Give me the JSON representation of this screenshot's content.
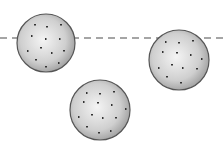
{
  "diagram": {
    "colors": {
      "background": "#ffffff",
      "sphere_light": "#f2f2f2",
      "sphere_dark": "#a8a8a8",
      "outline": "#555555",
      "speckle": "#333333",
      "dash_line": "#888888"
    },
    "reference_line": {
      "y": 38,
      "x1": 0,
      "x2": 223,
      "style": "dashed"
    },
    "spheres": [
      {
        "id": "left",
        "cx": 46,
        "cy": 43,
        "r": 29,
        "position": "crossing line"
      },
      {
        "id": "right",
        "cx": 179,
        "cy": 60,
        "r": 30,
        "position": "top touching line"
      },
      {
        "id": "bottom",
        "cx": 100,
        "cy": 110,
        "r": 30,
        "position": "below line"
      }
    ]
  }
}
